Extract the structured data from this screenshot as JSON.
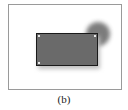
{
  "figure": {
    "caption": "(b)",
    "colors": {
      "frame_border": "#9a9a9a",
      "rectangle_fill": "#6a6a6a",
      "rectangle_border": "#1a1a1a",
      "blob_fill": "#6e6e6e"
    }
  }
}
